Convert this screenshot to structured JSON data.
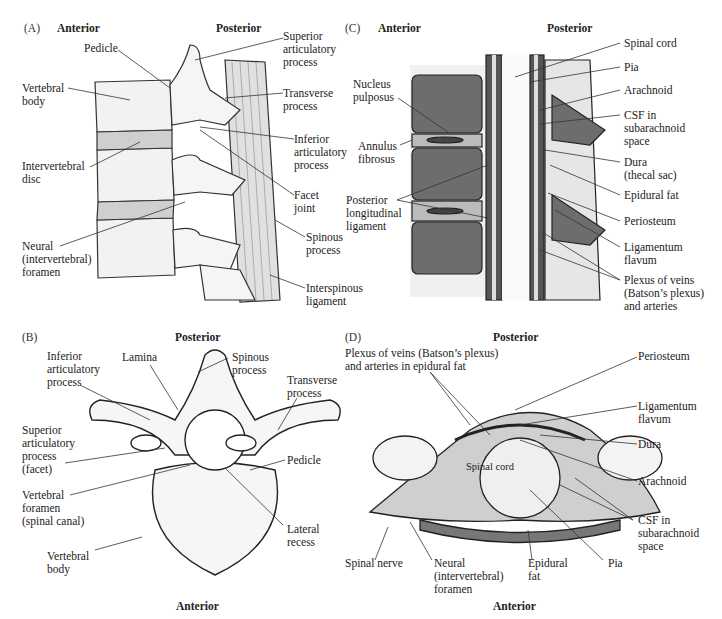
{
  "panels": {
    "A": {
      "panel_label": "(A)",
      "orientation": {
        "left": "Anterior",
        "right": "Posterior"
      },
      "labels": {
        "pedicle": "Pedicle",
        "superior_articular": "Superior\narticulatory\nprocess",
        "vertebral_body": "Vertebral\nbody",
        "transverse_process": "Transverse\nprocess",
        "inferior_articular": "Inferior\narticulatory\nprocess",
        "intervertebral_disc": "Intervertebral\ndisc",
        "facet_joint": "Facet\njoint",
        "neural_foramen": "Neural\n(intervertebral)\nforamen",
        "spinous_process": "Spinous\nprocess",
        "interspinous_ligament": "Interspinous\nligament"
      }
    },
    "B": {
      "panel_label": "(B)",
      "orientation": {
        "top": "Posterior",
        "bottom": "Anterior"
      },
      "labels": {
        "inferior_articular": "Inferior\narticulatory\nprocess",
        "lamina": "Lamina",
        "spinous_process": "Spinous\nprocess",
        "transverse_process": "Transverse\nprocess",
        "superior_articular": "Superior\narticulatory\nprocess\n(facet)",
        "pedicle": "Pedicle",
        "vertebral_foramen": "Vertebral\nforamen\n(spinal canal)",
        "lateral_recess": "Lateral\nrecess",
        "vertebral_body": "Vertebral\nbody"
      }
    },
    "C": {
      "panel_label": "(C)",
      "orientation": {
        "left": "Anterior",
        "right": "Posterior"
      },
      "labels": {
        "spinal_cord": "Spinal cord",
        "pia": "Pia",
        "nucleus_pulposus": "Nucleus\npulposus",
        "arachnoid": "Arachnoid",
        "csf": "CSF in\nsubarachnoid\nspace",
        "annulus_fibrosus": "Annulus\nfibrosus",
        "dura": "Dura\n(thecal sac)",
        "epidural_fat": "Epidural fat",
        "posterior_longitudinal": "Posterior\nlongitudinal\nligament",
        "periosteum": "Periosteum",
        "ligamentum_flavum": "Ligamentum\nflavum",
        "plexus": "Plexus of veins\n(Batson’s plexus)\nand arteries"
      }
    },
    "D": {
      "panel_label": "(D)",
      "orientation": {
        "top": "Posterior",
        "bottom": "Anterior"
      },
      "labels": {
        "plexus": "Plexus of veins (Batson’s plexus)\nand arteries in epidural fat",
        "periosteum": "Periosteum",
        "ligamentum_flavum": "Ligamentum\nflavum",
        "dura": "Dura",
        "spinal_cord": "Spinal cord",
        "arachnoid": "Arachnoid",
        "csf": "CSF in\nsubarachnoid\nspace",
        "spinal_nerve": "Spinal nerve",
        "neural_foramen": "Neural\n(intervertebral)\nforamen",
        "epidural_fat": "Epidural\nfat",
        "pia": "Pia"
      }
    }
  }
}
